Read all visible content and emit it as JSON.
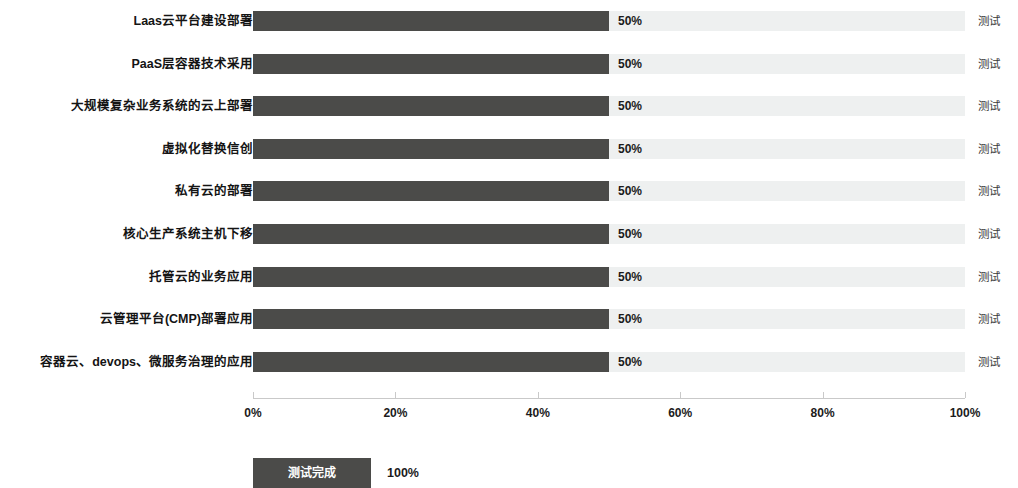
{
  "chart_data": {
    "type": "bar",
    "orientation": "horizontal",
    "title": "",
    "xlabel": "",
    "ylabel": "",
    "xlim": [
      0,
      100
    ],
    "grid": false,
    "legend_position": "bottom-left",
    "categories": [
      "Laas云平台建设部署",
      "PaaS层容器技术采用",
      "大规模复杂业务系统的云上部署",
      "虚拟化替换信创",
      "私有云的部署",
      "核心生产系统主机下移",
      "托管云的业务应用",
      "云管理平台(CMP)部署应用",
      "容器云、devops、微服务治理的应用"
    ],
    "values": [
      50,
      50,
      50,
      50,
      50,
      50,
      50,
      50,
      50
    ],
    "value_labels": [
      "50%",
      "50%",
      "50%",
      "50%",
      "50%",
      "50%",
      "50%",
      "50%",
      "50%"
    ],
    "row_right_labels": [
      "测试",
      "测试",
      "测试",
      "测试",
      "测试",
      "测试",
      "测试",
      "测试",
      "测试"
    ],
    "track_total_label": "100%",
    "x_ticks": [
      0,
      20,
      40,
      60,
      80,
      100
    ],
    "x_tick_labels": [
      "0%",
      "20%",
      "40%",
      "60%",
      "80%",
      "100%"
    ],
    "series": [
      {
        "name": "测试完成",
        "values": [
          50,
          50,
          50,
          50,
          50,
          50,
          50,
          50,
          50
        ]
      }
    ],
    "legend": [
      {
        "label": "测试完成",
        "value": "100%",
        "color": "#4b4b49"
      }
    ],
    "colors": {
      "bar_fill": "#4b4b49",
      "bar_track": "#eef0f0",
      "axis": "#c9c9c9",
      "text": "#1b1b1b"
    }
  }
}
